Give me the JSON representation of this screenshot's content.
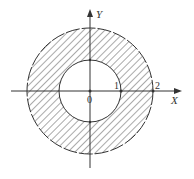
{
  "diagram": {
    "type": "annulus-region",
    "axes": {
      "x_label": "X",
      "y_label": "Y",
      "origin_label": "0"
    },
    "ticks": {
      "inner": "1",
      "outer": "2"
    },
    "geometry": {
      "cx": 90,
      "cy": 91,
      "inner_r": 31,
      "outer_r": 63
    },
    "fill": "hatched",
    "colors": {
      "stroke": "#333333",
      "hatch": "#555555",
      "background": "#ffffff"
    }
  }
}
